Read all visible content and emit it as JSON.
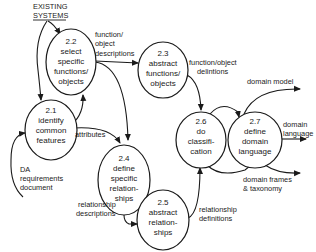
{
  "diagram": {
    "type": "data-flow-diagram",
    "external_source": {
      "line1": "EXISTING",
      "line2": "SYSTEMS"
    },
    "processes": [
      {
        "id": "2.1",
        "lines": [
          "2.1",
          "identify",
          "common",
          "features"
        ]
      },
      {
        "id": "2.2",
        "lines": [
          "2.2",
          "select",
          "specific",
          "functions/",
          "objects"
        ]
      },
      {
        "id": "2.3",
        "lines": [
          "2.3",
          "abstract",
          "functions/",
          "objects"
        ]
      },
      {
        "id": "2.4",
        "lines": [
          "2.4",
          "define",
          "specific",
          "relation-",
          "ships"
        ]
      },
      {
        "id": "2.5",
        "lines": [
          "2.5",
          "abstract",
          "relation-",
          "ships"
        ]
      },
      {
        "id": "2.6",
        "lines": [
          "2.6",
          "do",
          "classifi-",
          "cation"
        ]
      },
      {
        "id": "2.7",
        "lines": [
          "2.7",
          "define",
          "domain",
          "language"
        ]
      }
    ],
    "flows": [
      {
        "from": "EXISTING SYSTEMS",
        "to": "2.2",
        "label": ""
      },
      {
        "from": "EXISTING SYSTEMS",
        "to": "2.1",
        "label": ""
      },
      {
        "from": "2.1",
        "to": "2.2",
        "label": ""
      },
      {
        "from": "input",
        "to": "2.1",
        "label_lines": [
          "DA",
          "requirements",
          "document"
        ]
      },
      {
        "from": "2.2",
        "to": "2.3",
        "label_lines": [
          "function/",
          "object",
          "descriptions"
        ]
      },
      {
        "from": "2.2",
        "to": "2.4",
        "label": ""
      },
      {
        "from": "2.1",
        "to": "2.4",
        "label_lines": [
          "attributes"
        ]
      },
      {
        "from": "2.3",
        "to": "2.6",
        "label_lines": [
          "function/object",
          "delintions"
        ]
      },
      {
        "from": "2.4",
        "to": "2.5",
        "label_lines": [
          "relationship",
          "descriptions"
        ]
      },
      {
        "from": "2.5",
        "to": "2.6",
        "label_lines": [
          "relationship",
          "definitions"
        ]
      },
      {
        "from": "2.6",
        "to": "2.7",
        "label": ""
      },
      {
        "from": "2.7",
        "to": "2.6 (return)",
        "label": ""
      },
      {
        "from": "2.7",
        "to": "output",
        "label_lines": [
          "domain model"
        ]
      },
      {
        "from": "2.7",
        "to": "output",
        "label_lines": [
          "domain",
          "language"
        ]
      },
      {
        "from": "2.7",
        "to": "output",
        "label_lines": [
          "domain  frames",
          "& taxonomy"
        ]
      }
    ]
  }
}
